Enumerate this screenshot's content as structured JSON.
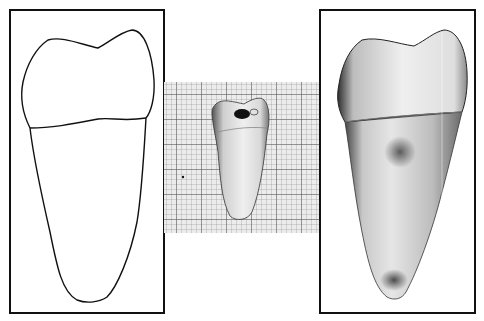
{
  "figure": {
    "panels": [
      {
        "id": "outline-drawing",
        "description": "line drawing outline of tooth with crown and root, cemento-enamel junction line"
      },
      {
        "id": "specimen-on-grid",
        "description": "photograph of extracted tooth specimen on millimeter graph paper"
      },
      {
        "id": "specimen-photo",
        "description": "enlarged photograph of tooth specimen"
      }
    ],
    "colors": {
      "border": "#111111",
      "grid_background": "#e9e9e9",
      "grid_minor": "#9a9a9a",
      "grid_major": "#555555",
      "tooth_light": "#f2f2f2",
      "tooth_shadow": "#3a3a3a"
    },
    "grid": {
      "minor_spacing_px": 5,
      "major_every": 5
    }
  }
}
